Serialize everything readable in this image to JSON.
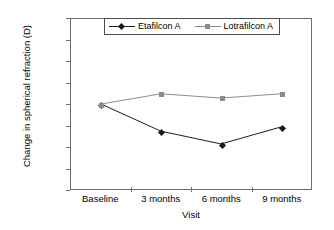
{
  "chart_data": {
    "type": "line",
    "title": "",
    "xlabel": "Visit",
    "ylabel": "Change in spherical refraction (D)",
    "categories": [
      "Baseline",
      "3 months",
      "6 months",
      "9 months"
    ],
    "ylim": [
      -1.0,
      1.0
    ],
    "yticks": [
      "1.00",
      "0.75",
      "0.50",
      "0.25",
      "0.00",
      "−0.25",
      "−0.50",
      "−0.75",
      "−1.00"
    ],
    "ytick_values": [
      1.0,
      0.75,
      0.5,
      0.25,
      0.0,
      -0.25,
      -0.5,
      -0.75,
      -1.0
    ],
    "grid": false,
    "legend_position": "top-center",
    "series": [
      {
        "name": "Etafilcon A",
        "values": [
          0.0,
          -0.32,
          -0.47,
          -0.27
        ],
        "color": "#1a1a1a",
        "marker": "diamond"
      },
      {
        "name": "Lotrafilcon A",
        "values": [
          0.0,
          0.12,
          0.07,
          0.12
        ],
        "color": "#8c8c8c",
        "marker": "square"
      }
    ]
  }
}
